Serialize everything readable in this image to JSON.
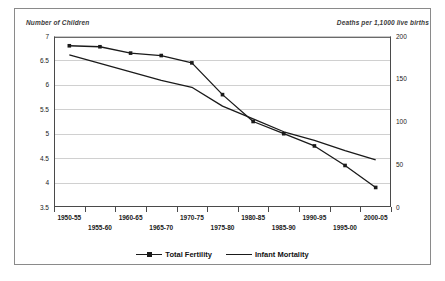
{
  "page": {
    "top_clipped_text": "",
    "background": "#ffffff",
    "frame_color": "#8a8a8a"
  },
  "chart_data": {
    "type": "line",
    "title": "",
    "xlabel": "",
    "ylabel": "Number of Children",
    "y2label": "Deaths per 1,1000 live births",
    "grid": true,
    "legend_position": "bottom",
    "categories": [
      "1950-55",
      "1955-60",
      "1960-65",
      "1965-70",
      "1970-75",
      "1975-80",
      "1980-85",
      "1985-90",
      "1990-95",
      "1995-00",
      "2000-05"
    ],
    "left_axis": {
      "label": "Number of Children",
      "ylim": [
        3.5,
        7
      ],
      "ticks": [
        "3.5",
        "4",
        "4.5",
        "5",
        "5.5",
        "6",
        "6.5",
        "7"
      ],
      "tick_values": [
        3.5,
        4,
        4.5,
        5,
        5.5,
        6,
        6.5,
        7
      ]
    },
    "right_axis": {
      "label": "Deaths per 1,1000 live births",
      "ylim": [
        0,
        200
      ],
      "ticks": [
        "0",
        "50",
        "100",
        "150",
        "200"
      ],
      "tick_values": [
        0,
        50,
        100,
        150,
        200
      ]
    },
    "series": [
      {
        "name": "Total Fertility",
        "axis": "left",
        "marker": "square",
        "color": "#1a1a1a",
        "values": [
          6.8,
          6.78,
          6.65,
          6.6,
          6.45,
          5.8,
          5.25,
          5.0,
          4.75,
          4.35,
          3.9
        ]
      },
      {
        "name": "Infant Mortality",
        "axis": "right",
        "marker": "none",
        "color": "#1a1a1a",
        "values": [
          178,
          168,
          158,
          148,
          140,
          118,
          103,
          88,
          78,
          66,
          55
        ]
      }
    ]
  },
  "legend": {
    "items": [
      {
        "label": "Total Fertility",
        "marker": "square"
      },
      {
        "label": "Infant Mortality",
        "marker": "none"
      }
    ]
  }
}
